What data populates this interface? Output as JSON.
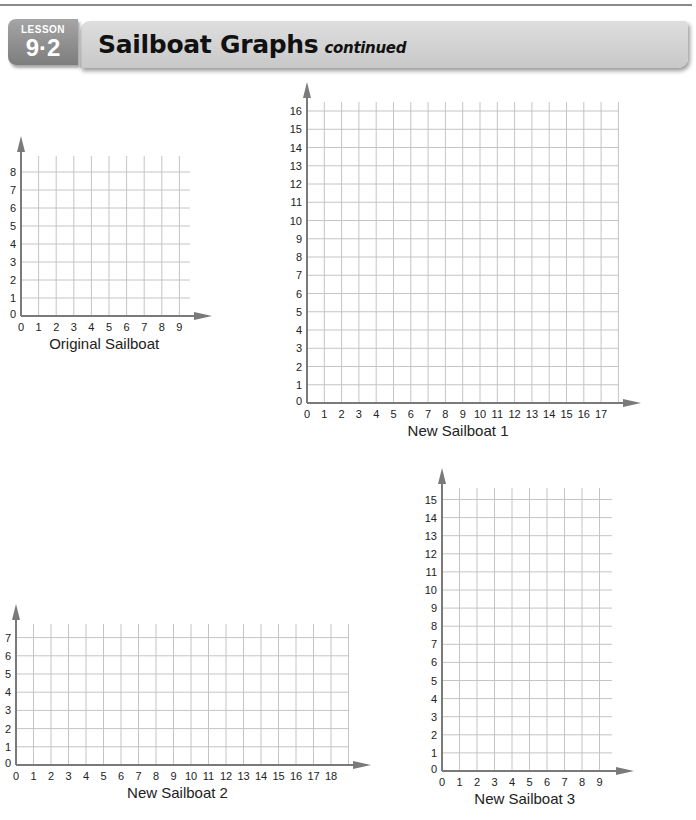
{
  "header": {
    "lesson_word": "LESSON",
    "lesson_number": "9·2",
    "title": "Sailboat Graphs",
    "title_suffix": "continued"
  },
  "colors": {
    "grid": "#c4c4c4",
    "axis": "#7a7a7a",
    "label": "#222222",
    "badge": "#8f8f8f",
    "title_bar": "#d4d4d4"
  },
  "chart_data": [
    {
      "type": "grid",
      "id": "original",
      "title": "Original Sailboat",
      "x_ticks": [
        0,
        1,
        2,
        3,
        4,
        5,
        6,
        7,
        8,
        9
      ],
      "y_ticks": [
        0,
        1,
        2,
        3,
        4,
        5,
        6,
        7,
        8
      ],
      "xlim": [
        0,
        9.6
      ],
      "ylim": [
        0,
        8.8
      ],
      "grid": true,
      "geom": {
        "ox": 21,
        "oy": 316,
        "ux": 17.6,
        "uy": 18.0,
        "grid_w": 169,
        "grid_h": 160
      }
    },
    {
      "type": "grid",
      "id": "new1",
      "title": "New Sailboat 1",
      "x_ticks": [
        0,
        1,
        2,
        3,
        4,
        5,
        6,
        7,
        8,
        9,
        10,
        11,
        12,
        13,
        14,
        15,
        16,
        17
      ],
      "y_ticks": [
        0,
        1,
        2,
        3,
        4,
        5,
        6,
        7,
        8,
        9,
        10,
        11,
        12,
        13,
        14,
        15,
        16
      ],
      "xlim": [
        0,
        17.6
      ],
      "ylim": [
        0,
        16.4
      ],
      "grid": true,
      "geom": {
        "ox": 307,
        "oy": 403,
        "ux": 17.3,
        "uy": 18.25,
        "grid_w": 312,
        "grid_h": 301
      }
    },
    {
      "type": "grid",
      "id": "new2",
      "title": "New Sailboat 2",
      "x_ticks": [
        0,
        1,
        2,
        3,
        4,
        5,
        6,
        7,
        8,
        9,
        10,
        11,
        12,
        13,
        14,
        15,
        16,
        17,
        18
      ],
      "y_ticks": [
        0,
        1,
        2,
        3,
        4,
        5,
        6,
        7
      ],
      "xlim": [
        0,
        18.6
      ],
      "ylim": [
        0,
        7.6
      ],
      "grid": true,
      "geom": {
        "ox": 16,
        "oy": 765,
        "ux": 17.5,
        "uy": 18.2,
        "grid_w": 333,
        "grid_h": 141
      }
    },
    {
      "type": "grid",
      "id": "new3",
      "title": "New Sailboat 3",
      "x_ticks": [
        0,
        1,
        2,
        3,
        4,
        5,
        6,
        7,
        8,
        9
      ],
      "y_ticks": [
        0,
        1,
        2,
        3,
        4,
        5,
        6,
        7,
        8,
        9,
        10,
        11,
        12,
        13,
        14,
        15
      ],
      "xlim": [
        0,
        9.6
      ],
      "ylim": [
        0,
        15.6
      ],
      "grid": true,
      "geom": {
        "ox": 442,
        "oy": 771,
        "ux": 17.5,
        "uy": 18.1,
        "grid_w": 170,
        "grid_h": 283
      }
    }
  ]
}
